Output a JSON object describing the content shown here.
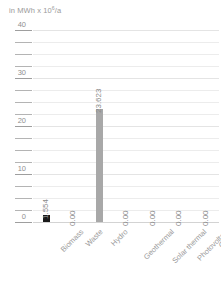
{
  "chart_data": {
    "type": "bar",
    "title_parts": {
      "prefix": "in MWh x 10",
      "exponent": "6",
      "suffix": "/a"
    },
    "xlabel": "",
    "ylabel": "in MWh x 10⁶/a",
    "categories": [
      "Biomass",
      "Waste",
      "Hydro",
      "Geothermal",
      "Solar thermal",
      "Photovoltaic",
      "Others"
    ],
    "values": [
      1.554,
      0.0,
      23.623,
      0.0,
      0.0,
      0.0,
      0.0
    ],
    "value_labels": [
      "1.554",
      "0.00",
      "23.623",
      "0.00",
      "0.00",
      "0.00",
      "0.00"
    ],
    "bar_colors": [
      "#1a1a1a",
      "#a8a8a8",
      "#a8a8a8",
      "#a8a8a8",
      "#a8a8a8",
      "#a8a8a8",
      "#a8a8a8"
    ],
    "ylim": [
      0,
      40
    ],
    "ytick_labels": [
      "0",
      "10",
      "20",
      "30",
      "40"
    ],
    "ytick_values": [
      0,
      10,
      20,
      30,
      40
    ],
    "minor_tick_step": 2.5,
    "grid": true,
    "grid_axis": "y",
    "legend": null,
    "legend_position": "none",
    "colors": {
      "grid": "#ececec",
      "axis": "#d3d3d3",
      "tick": "#b4b4b4",
      "text": "#8f8f8f",
      "bar_primary": "#1a1a1a",
      "bar_secondary": "#a8a8a8",
      "background": "#ffffff"
    }
  }
}
